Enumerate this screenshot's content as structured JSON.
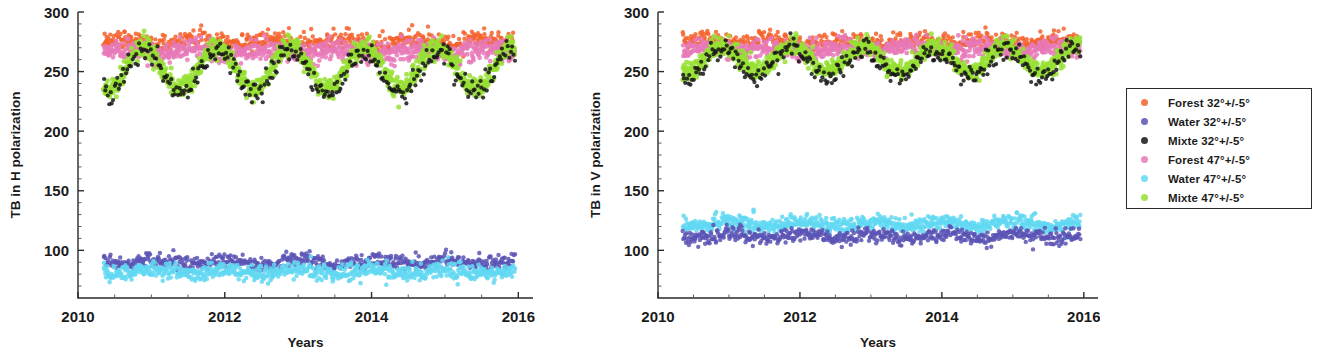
{
  "figure": {
    "background": "#ffffff"
  },
  "legend": {
    "name": "series-legend",
    "border_color": "#2b2b2b",
    "items": [
      {
        "label": "Forest 32°+/-5°",
        "color": "#f4622b",
        "key": "forest32"
      },
      {
        "label": "Water 32°+/-5°",
        "color": "#5b53b5",
        "key": "water32"
      },
      {
        "label": "Mixte 32°+/-5°",
        "color": "#161616",
        "key": "mixte32"
      },
      {
        "label": "Forest 47°+/-5°",
        "color": "#e879b8",
        "key": "forest47"
      },
      {
        "label": "Water 47°+/-5°",
        "color": "#62d8f2",
        "key": "water47"
      },
      {
        "label": "Mixte 47°+/-5°",
        "color": "#97e032",
        "key": "mixte47"
      }
    ]
  },
  "chart_data": [
    {
      "id": "panel-h",
      "type": "scatter",
      "title": "",
      "xlabel": "Years",
      "ylabel": "TB in H polarization",
      "xlim": [
        2010.0,
        2016.2
      ],
      "ylim": [
        60,
        300
      ],
      "xticks": [
        2010,
        2012,
        2014,
        2016
      ],
      "xticklabels": [
        "2010",
        "2012",
        "2014",
        "2016"
      ],
      "yticks": [
        100,
        150,
        200,
        250,
        300
      ],
      "yticklabels": [
        "100",
        "150",
        "200",
        "250",
        "300"
      ],
      "yminorticks": [
        70,
        80,
        90,
        110,
        120,
        130,
        140,
        160,
        170,
        180,
        190,
        210,
        220,
        230,
        240,
        260,
        270,
        280,
        290
      ],
      "xminorticks": [
        2010.5,
        2011,
        2011.5,
        2012.5,
        2013,
        2013.5,
        2014.5,
        2015,
        2015.5
      ],
      "grid": false,
      "x_start": 2010.35,
      "x_end": 2015.95,
      "legend_position": "outside-right",
      "series": [
        {
          "name": "Forest 32°+/-5°",
          "color": "#f4622b",
          "mean": 275,
          "amplitude": 2.5,
          "noise": 4.0,
          "phase": 0.0,
          "n": 620,
          "size": 2.2
        },
        {
          "name": "Forest 47°+/-5°",
          "color": "#e879b8",
          "mean": 267,
          "amplitude": 2.0,
          "noise": 4.5,
          "phase": 0.0,
          "n": 760,
          "size": 2.4
        },
        {
          "name": "Mixte 47°+/-5°",
          "color": "#97e032",
          "mean": 253,
          "amplitude": 18,
          "noise": 4.5,
          "phase": 0.3,
          "n": 900,
          "size": 2.5
        },
        {
          "name": "Mixte 32°+/-5°",
          "color": "#161616",
          "mean": 249,
          "amplitude": 18,
          "noise": 5.0,
          "phase": 0.3,
          "n": 300,
          "size": 2.1
        },
        {
          "name": "Water 32°+/-5°",
          "color": "#5b53b5",
          "mean": 90,
          "amplitude": 2.0,
          "noise": 3.2,
          "phase": 0.45,
          "n": 560,
          "size": 2.2
        },
        {
          "name": "Water 47°+/-5°",
          "color": "#62d8f2",
          "mean": 82,
          "amplitude": 2.0,
          "noise": 3.5,
          "phase": 0.45,
          "n": 700,
          "size": 2.3
        }
      ]
    },
    {
      "id": "panel-v",
      "type": "scatter",
      "title": "",
      "xlabel": "Years",
      "ylabel": "TB in V polarization",
      "xlim": [
        2010.0,
        2016.2
      ],
      "ylim": [
        60,
        300
      ],
      "xticks": [
        2010,
        2012,
        2014,
        2016
      ],
      "xticklabels": [
        "2010",
        "2012",
        "2014",
        "2016"
      ],
      "yticks": [
        100,
        150,
        200,
        250,
        300
      ],
      "yticklabels": [
        "100",
        "150",
        "200",
        "250",
        "300"
      ],
      "yminorticks": [
        70,
        80,
        90,
        110,
        120,
        130,
        140,
        160,
        170,
        180,
        190,
        210,
        220,
        230,
        240,
        260,
        270,
        280,
        290
      ],
      "xminorticks": [
        2010.5,
        2011,
        2011.5,
        2012.5,
        2013,
        2013.5,
        2014.5,
        2015,
        2015.5
      ],
      "grid": false,
      "x_start": 2010.35,
      "x_end": 2015.95,
      "legend_position": "outside-right",
      "series": [
        {
          "name": "Forest 32°+/-5°",
          "color": "#f4622b",
          "mean": 275,
          "amplitude": 2.0,
          "noise": 3.6,
          "phase": 0.0,
          "n": 560,
          "size": 2.2
        },
        {
          "name": "Forest 47°+/-5°",
          "color": "#e879b8",
          "mean": 269,
          "amplitude": 1.8,
          "noise": 4.0,
          "phase": 0.0,
          "n": 740,
          "size": 2.4
        },
        {
          "name": "Mixte 47°+/-5°",
          "color": "#97e032",
          "mean": 261,
          "amplitude": 11,
          "noise": 4.0,
          "phase": 0.3,
          "n": 900,
          "size": 2.5
        },
        {
          "name": "Mixte 32°+/-5°",
          "color": "#161616",
          "mean": 257,
          "amplitude": 12,
          "noise": 4.5,
          "phase": 0.3,
          "n": 300,
          "size": 2.1
        },
        {
          "name": "Water 47°+/-5°",
          "color": "#62d8f2",
          "mean": 122,
          "amplitude": 2.0,
          "noise": 3.2,
          "phase": 0.45,
          "n": 700,
          "size": 2.3
        },
        {
          "name": "Water 32°+/-5°",
          "color": "#5b53b5",
          "mean": 112,
          "amplitude": 2.0,
          "noise": 3.0,
          "phase": 0.45,
          "n": 560,
          "size": 2.2
        }
      ]
    }
  ]
}
